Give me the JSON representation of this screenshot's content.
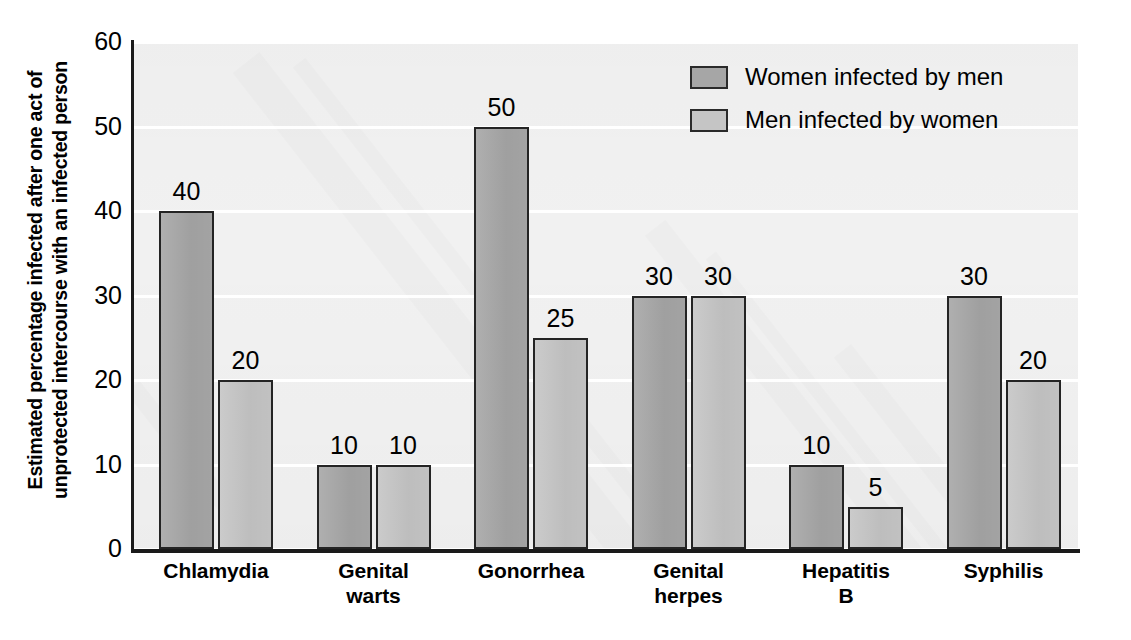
{
  "chart_data": {
    "type": "bar",
    "title": "",
    "xlabel": "",
    "ylabel": "Estimated percentage infected after one act of unprotected intercourse with an infected person",
    "ylabel_lines": [
      "Estimated percentage infected after one act of",
      "unprotected intercourse with an infected person"
    ],
    "ylim": [
      0,
      60
    ],
    "yticks": [
      0,
      10,
      20,
      30,
      40,
      50,
      60
    ],
    "ytick_labels": [
      "0",
      "10",
      "20",
      "30",
      "40",
      "50",
      "60"
    ],
    "grid": true,
    "legend_position": "top-right",
    "categories": [
      "Chlamydia",
      "Genital warts",
      "Gonorrhea",
      "Genital herpes",
      "Hepatitis B",
      "Syphilis"
    ],
    "category_label_lines": [
      [
        "Chlamydia"
      ],
      [
        "Genital",
        "warts"
      ],
      [
        "Gonorrhea"
      ],
      [
        "Genital",
        "herpes"
      ],
      [
        "Hepatitis",
        "B"
      ],
      [
        "Syphilis"
      ]
    ],
    "series": [
      {
        "name": "Women infected by men",
        "color": "#a6a6a6",
        "values": [
          40,
          10,
          50,
          30,
          10,
          30
        ],
        "value_labels": [
          "40",
          "10",
          "50",
          "30",
          "10",
          "30"
        ]
      },
      {
        "name": "Men infected by women",
        "color": "#c5c5c5",
        "values": [
          20,
          10,
          25,
          30,
          5,
          20
        ],
        "value_labels": [
          "20",
          "10",
          "25",
          "30",
          "5",
          "20"
        ]
      }
    ]
  },
  "legend": {
    "items": [
      {
        "label": "Women infected by men",
        "swatch": "s0"
      },
      {
        "label": "Men infected by women",
        "swatch": "s1"
      }
    ]
  },
  "colors": {
    "series_women": "#a6a6a6",
    "series_men": "#c5c5c5",
    "plot_background": "#f1f1f1",
    "gridline": "#ffffff",
    "axis": "#1a1a1a",
    "text": "#000000"
  }
}
